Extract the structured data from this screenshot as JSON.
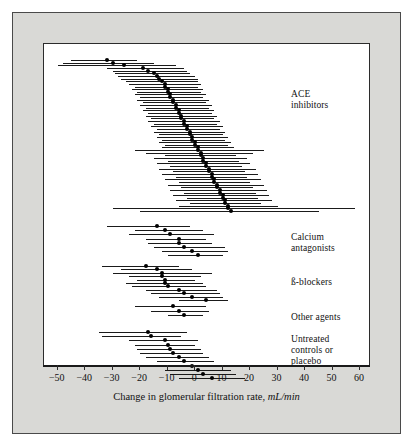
{
  "figure": {
    "background": "#d9d9d6",
    "panel_background": "#ffffff",
    "border_color": "#2b2b2b",
    "marker_color": "#000000"
  },
  "axis": {
    "label_text": "Change in glomerular filtration rate, ",
    "label_unit": "mL/min",
    "ticks": [
      "−50",
      "−40",
      "−30",
      "−20",
      "−10",
      "0",
      "10",
      "20",
      "30",
      "40",
      "50",
      "60"
    ],
    "tick_values": [
      -50,
      -40,
      -30,
      -20,
      -10,
      0,
      10,
      20,
      30,
      40,
      50,
      60
    ],
    "xmin": -55,
    "xmax": 64
  },
  "groups": [
    {
      "name": "ACE inhibitors",
      "label_lines": [
        "ACE",
        "inhibitors"
      ],
      "label_top": 75
    },
    {
      "name": "Calcium antagonists",
      "label_lines": [
        "Calcium",
        "antagonists"
      ],
      "label_top": 218
    },
    {
      "name": "ß-blockers",
      "label_lines": [
        "ß-blockers"
      ],
      "label_top": 263
    },
    {
      "name": "Other agents",
      "label_lines": [
        "Other agents"
      ],
      "label_top": 298
    },
    {
      "name": "Untreated controls or placebo",
      "label_lines": [
        "Untreated",
        "controls or",
        "placebo"
      ],
      "label_top": 320
    }
  ],
  "chart_data": {
    "type": "scatter",
    "title": "",
    "subtitle": "",
    "xlabel": "Change in glomerular filtration rate, mL/min",
    "ylabel": "",
    "xlim": [
      -55,
      64
    ],
    "grid": false,
    "legend_position": "right",
    "plot_style": "forest plot (caterpillar plot) of study estimates with 95% confidence intervals, sorted within treatment groups",
    "series": [
      {
        "name": "ACE inhibitors",
        "group_label": [
          "ACE",
          "inhibitors"
        ],
        "points": [
          {
            "y": 1,
            "estimate": -32,
            "low": -45,
            "high": -21
          },
          {
            "y": 2,
            "estimate": -30,
            "low": -48,
            "high": -15
          },
          {
            "y": 3,
            "estimate": -26,
            "low": -50,
            "high": -7
          },
          {
            "y": 4,
            "estimate": -19,
            "low": -32,
            "high": -4
          },
          {
            "y": 5,
            "estimate": -17,
            "low": -30,
            "high": -3
          },
          {
            "y": 6,
            "estimate": -15,
            "low": -29,
            "high": -2
          },
          {
            "y": 7,
            "estimate": -14,
            "low": -28,
            "high": 0
          },
          {
            "y": 8,
            "estimate": -13,
            "low": -27,
            "high": 1
          },
          {
            "y": 9,
            "estimate": -12,
            "low": -25,
            "high": 1
          },
          {
            "y": 10,
            "estimate": -11,
            "low": -24,
            "high": 2
          },
          {
            "y": 11,
            "estimate": -11,
            "low": -22,
            "high": 1
          },
          {
            "y": 12,
            "estimate": -10,
            "low": -23,
            "high": 3
          },
          {
            "y": 13,
            "estimate": -10,
            "low": -21,
            "high": 2
          },
          {
            "y": 14,
            "estimate": -9,
            "low": -22,
            "high": 4
          },
          {
            "y": 15,
            "estimate": -9,
            "low": -20,
            "high": 3
          },
          {
            "y": 16,
            "estimate": -8,
            "low": -21,
            "high": 5
          },
          {
            "y": 17,
            "estimate": -8,
            "low": -19,
            "high": 4
          },
          {
            "y": 18,
            "estimate": -7,
            "low": -20,
            "high": 6
          },
          {
            "y": 19,
            "estimate": -7,
            "low": -18,
            "high": 5
          },
          {
            "y": 20,
            "estimate": -6,
            "low": -19,
            "high": 7
          },
          {
            "y": 21,
            "estimate": -6,
            "low": -17,
            "high": 6
          },
          {
            "y": 22,
            "estimate": -5,
            "low": -18,
            "high": 8
          },
          {
            "y": 23,
            "estimate": -5,
            "low": -16,
            "high": 7
          },
          {
            "y": 24,
            "estimate": -4,
            "low": -17,
            "high": 9
          },
          {
            "y": 25,
            "estimate": -4,
            "low": -15,
            "high": 8
          },
          {
            "y": 26,
            "estimate": -3,
            "low": -16,
            "high": 10
          },
          {
            "y": 27,
            "estimate": -3,
            "low": -14,
            "high": 9
          },
          {
            "y": 28,
            "estimate": -2,
            "low": -15,
            "high": 11
          },
          {
            "y": 29,
            "estimate": -2,
            "low": -13,
            "high": 10
          },
          {
            "y": 30,
            "estimate": -1,
            "low": -14,
            "high": 12
          },
          {
            "y": 31,
            "estimate": -1,
            "low": -12,
            "high": 11
          },
          {
            "y": 32,
            "estimate": 0,
            "low": -13,
            "high": 13
          },
          {
            "y": 33,
            "estimate": 0,
            "low": -11,
            "high": 12
          },
          {
            "y": 34,
            "estimate": 1,
            "low": -12,
            "high": 14
          },
          {
            "y": 35,
            "estimate": 1,
            "low": -22,
            "high": 25
          },
          {
            "y": 36,
            "estimate": 2,
            "low": -18,
            "high": 21
          },
          {
            "y": 37,
            "estimate": 2,
            "low": -11,
            "high": 15
          },
          {
            "y": 38,
            "estimate": 3,
            "low": -15,
            "high": 19
          },
          {
            "y": 39,
            "estimate": 3,
            "low": -10,
            "high": 16
          },
          {
            "y": 40,
            "estimate": 4,
            "low": -14,
            "high": 20
          },
          {
            "y": 41,
            "estimate": 4,
            "low": -9,
            "high": 17
          },
          {
            "y": 42,
            "estimate": 5,
            "low": -13,
            "high": 22
          },
          {
            "y": 43,
            "estimate": 5,
            "low": -8,
            "high": 18
          },
          {
            "y": 44,
            "estimate": 6,
            "low": -12,
            "high": 23
          },
          {
            "y": 45,
            "estimate": 6,
            "low": -7,
            "high": 19
          },
          {
            "y": 46,
            "estimate": 7,
            "low": -11,
            "high": 24
          },
          {
            "y": 47,
            "estimate": 7,
            "low": -6,
            "high": 20
          },
          {
            "y": 48,
            "estimate": 8,
            "low": -10,
            "high": 25
          },
          {
            "y": 49,
            "estimate": 8,
            "low": -5,
            "high": 21
          },
          {
            "y": 50,
            "estimate": 9,
            "low": -9,
            "high": 26
          },
          {
            "y": 51,
            "estimate": 9,
            "low": -4,
            "high": 22
          },
          {
            "y": 52,
            "estimate": 10,
            "low": -8,
            "high": 27
          },
          {
            "y": 53,
            "estimate": 10,
            "low": -3,
            "high": 23
          },
          {
            "y": 54,
            "estimate": 11,
            "low": -7,
            "high": 28
          },
          {
            "y": 55,
            "estimate": 11,
            "low": -2,
            "high": 24
          },
          {
            "y": 56,
            "estimate": 12,
            "low": -6,
            "high": 30
          },
          {
            "y": 57,
            "estimate": 12,
            "low": -30,
            "high": 58
          },
          {
            "y": 58,
            "estimate": 13,
            "low": -20,
            "high": 45
          }
        ]
      },
      {
        "name": "Calcium antagonists",
        "group_label": [
          "Calcium",
          "antagonists"
        ],
        "points": [
          {
            "y": 1,
            "estimate": -14,
            "low": -32,
            "high": -2
          },
          {
            "y": 2,
            "estimate": -11,
            "low": -22,
            "high": 3
          },
          {
            "y": 3,
            "estimate": -9,
            "low": -24,
            "high": 7
          },
          {
            "y": 4,
            "estimate": -6,
            "low": -18,
            "high": 4
          },
          {
            "y": 5,
            "estimate": -6,
            "low": -17,
            "high": 6
          },
          {
            "y": 6,
            "estimate": -4,
            "low": -15,
            "high": 11
          },
          {
            "y": 7,
            "estimate": -1,
            "low": -12,
            "high": 12
          },
          {
            "y": 8,
            "estimate": 1,
            "low": -10,
            "high": 10
          }
        ]
      },
      {
        "name": "ß-blockers",
        "group_label": [
          "ß-blockers"
        ],
        "points": [
          {
            "y": 1,
            "estimate": -18,
            "low": -34,
            "high": -6
          },
          {
            "y": 2,
            "estimate": -14,
            "low": -27,
            "high": -1
          },
          {
            "y": 3,
            "estimate": -12,
            "low": -30,
            "high": 6
          },
          {
            "y": 4,
            "estimate": -12,
            "low": -24,
            "high": 2
          },
          {
            "y": 5,
            "estimate": -11,
            "low": -21,
            "high": 0
          },
          {
            "y": 6,
            "estimate": -11,
            "low": -25,
            "high": 3
          },
          {
            "y": 7,
            "estimate": -10,
            "low": -23,
            "high": 4
          },
          {
            "y": 8,
            "estimate": -6,
            "low": -18,
            "high": 8
          },
          {
            "y": 9,
            "estimate": -4,
            "low": -16,
            "high": 9
          },
          {
            "y": 10,
            "estimate": -1,
            "low": -13,
            "high": 10
          },
          {
            "y": 11,
            "estimate": 4,
            "low": -6,
            "high": 12
          }
        ]
      },
      {
        "name": "Other agents",
        "group_label": [
          "Other agents"
        ],
        "points": [
          {
            "y": 1,
            "estimate": -8,
            "low": -22,
            "high": 4
          },
          {
            "y": 2,
            "estimate": -6,
            "low": -16,
            "high": 5
          },
          {
            "y": 3,
            "estimate": -4,
            "low": -10,
            "high": 3
          }
        ]
      },
      {
        "name": "Untreated controls or placebo",
        "group_label": [
          "Untreated",
          "controls or",
          "placebo"
        ],
        "points": [
          {
            "y": 1,
            "estimate": -17,
            "low": -35,
            "high": -3
          },
          {
            "y": 2,
            "estimate": -16,
            "low": -34,
            "high": -5
          },
          {
            "y": 3,
            "estimate": -11,
            "low": -24,
            "high": 1
          },
          {
            "y": 4,
            "estimate": -10,
            "low": -22,
            "high": 0
          },
          {
            "y": 5,
            "estimate": -9,
            "low": -21,
            "high": 2
          },
          {
            "y": 6,
            "estimate": -8,
            "low": -20,
            "high": 3
          },
          {
            "y": 7,
            "estimate": -6,
            "low": -18,
            "high": 5
          },
          {
            "y": 8,
            "estimate": -4,
            "low": -14,
            "high": 7
          },
          {
            "y": 9,
            "estimate": -1,
            "low": -12,
            "high": 9
          },
          {
            "y": 10,
            "estimate": 1,
            "low": -11,
            "high": 13
          },
          {
            "y": 11,
            "estimate": 3,
            "low": -9,
            "high": 15
          },
          {
            "y": 12,
            "estimate": 6,
            "low": -6,
            "high": 18
          }
        ]
      }
    ]
  }
}
